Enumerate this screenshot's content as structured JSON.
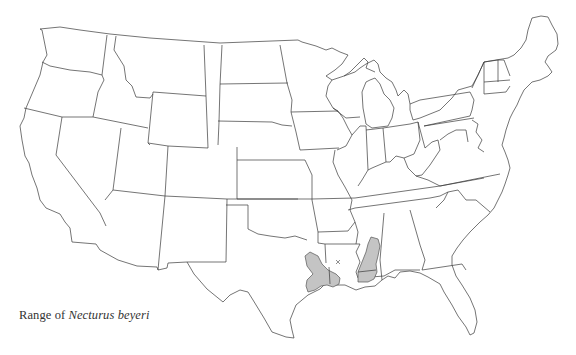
{
  "map": {
    "title": "Range of Necturus beyeri",
    "caption": {
      "prefix": "Range of ",
      "species": "Necturus beyeri"
    },
    "region": "Contiguous United States",
    "range_color": "#c4c4c4",
    "outline_color": "#3a3a3a",
    "background_color": "#ffffff",
    "range_areas": [
      {
        "name": "east-texas-western-louisiana",
        "states": [
          "Texas",
          "Louisiana"
        ]
      },
      {
        "name": "mississippi-eastern-louisiana",
        "states": [
          "Mississippi",
          "Louisiana"
        ]
      }
    ],
    "markers": [
      {
        "symbol": "x",
        "state": "Louisiana"
      }
    ]
  }
}
